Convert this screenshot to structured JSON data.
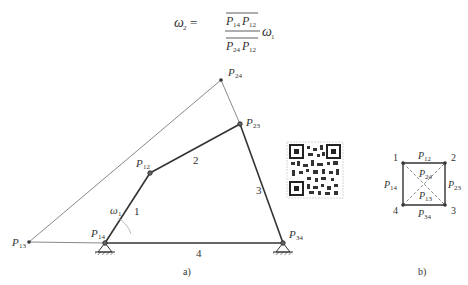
{
  "formula": {
    "lhs": "ω",
    "lhs_sub": "2",
    "equals": "=",
    "numerator_p1": "P",
    "numerator_p1_sub": "14",
    "numerator_p2": "P",
    "numerator_p2_sub": "12",
    "denominator_p1": "P",
    "denominator_p1_sub": "24",
    "denominator_p2": "P",
    "denominator_p2_sub": "12",
    "rhs": "ω",
    "rhs_sub": "1"
  },
  "figure_a": {
    "caption": "a)",
    "points": {
      "P24": {
        "label": "P",
        "sub": "24",
        "x": 221,
        "y": 80
      },
      "P23": {
        "label": "P",
        "sub": "23",
        "x": 240,
        "y": 124
      },
      "P12": {
        "label": "P",
        "sub": "12",
        "x": 150,
        "y": 173
      },
      "P14": {
        "label": "P",
        "sub": "14",
        "x": 105,
        "y": 243
      },
      "P34": {
        "label": "P",
        "sub": "34",
        "x": 283,
        "y": 243
      },
      "P13": {
        "label": "P",
        "sub": "13",
        "x": 29,
        "y": 242
      }
    },
    "link_labels": {
      "link1": "1",
      "link2": "2",
      "link3": "3",
      "link4": "4"
    },
    "omega1": {
      "label": "ω",
      "sub": "1"
    }
  },
  "figure_b": {
    "caption": "b)",
    "vertices": {
      "v1": "1",
      "v2": "2",
      "v3": "3",
      "v4": "4"
    },
    "edges": {
      "top": {
        "label": "P",
        "sub": "12"
      },
      "left": {
        "label": "P",
        "sub": "14"
      },
      "right": {
        "label": "P",
        "sub": "23"
      },
      "bottom": {
        "label": "P",
        "sub": "34"
      },
      "diag24": {
        "label": "P",
        "sub": "24"
      },
      "diag13": {
        "label": "P",
        "sub": "13"
      }
    }
  },
  "qr_code": {
    "present": true
  }
}
